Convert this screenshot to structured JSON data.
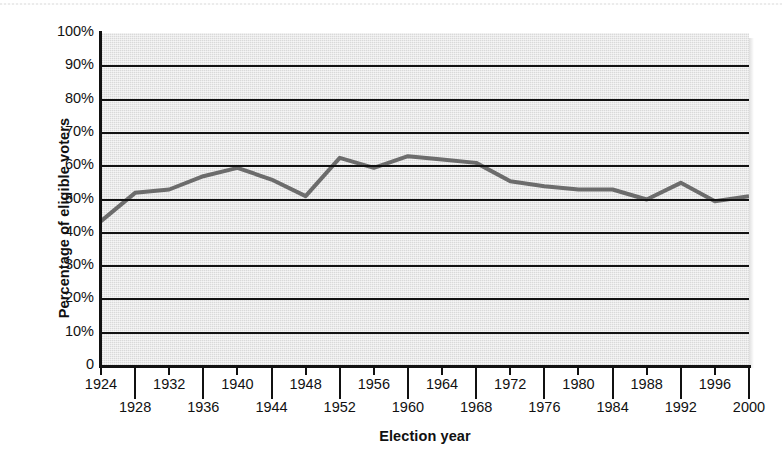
{
  "chart_data": {
    "type": "line",
    "title": "",
    "xlabel": "Election year",
    "ylabel": "Percentage of eligible voters",
    "xlim": [
      1924,
      2000
    ],
    "ylim": [
      0,
      100
    ],
    "grid": true,
    "legend": null,
    "y_ticks": [
      "0",
      "10%",
      "20%",
      "30%",
      "40%",
      "50%",
      "60%",
      "70%",
      "80%",
      "90%",
      "100%"
    ],
    "y_tick_values": [
      0,
      10,
      20,
      30,
      40,
      50,
      60,
      70,
      80,
      90,
      100
    ],
    "x_ticks_upper": [
      "1924",
      "1932",
      "1940",
      "1948",
      "1956",
      "1964",
      "1972",
      "1980",
      "1988",
      "1996"
    ],
    "x_ticks_lower": [
      "1928",
      "1936",
      "1944",
      "1952",
      "1960",
      "1968",
      "1976",
      "1984",
      "1992",
      "2000"
    ],
    "x": [
      1924,
      1928,
      1932,
      1936,
      1940,
      1944,
      1948,
      1952,
      1956,
      1960,
      1964,
      1968,
      1972,
      1976,
      1980,
      1984,
      1988,
      1992,
      1996,
      2000
    ],
    "values": [
      43.5,
      52,
      53,
      57,
      59.5,
      56,
      51,
      62.5,
      59.5,
      63,
      62,
      61,
      55.5,
      54,
      53,
      53,
      50,
      55,
      49.5,
      51
    ],
    "series": [
      {
        "name": "Voter turnout",
        "color": "#6c6c6c",
        "values": [
          43.5,
          52,
          53,
          57,
          59.5,
          56,
          51,
          62.5,
          59.5,
          63,
          62,
          61,
          55.5,
          54,
          53,
          53,
          50,
          55,
          49.5,
          51
        ]
      }
    ],
    "plot_background": "#d9d9d9",
    "axis_color": "#111111"
  }
}
